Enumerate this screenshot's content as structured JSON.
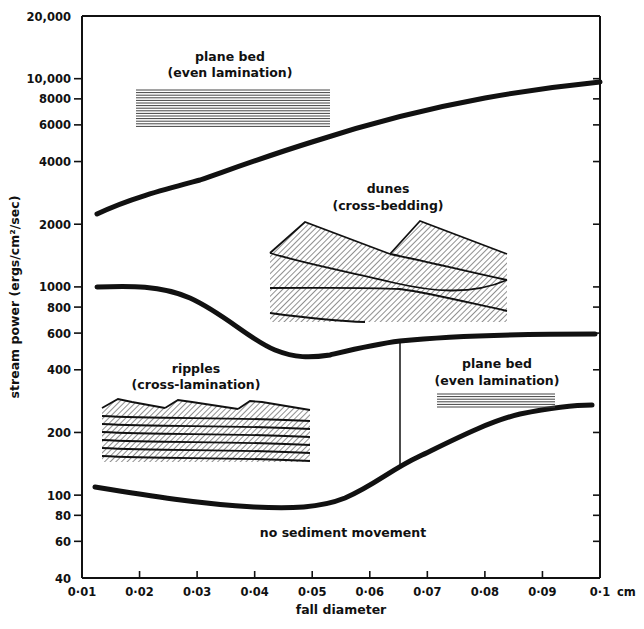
{
  "chart_data": {
    "type": "line",
    "title": "",
    "xlabel": "fall diameter",
    "x_unit": "cm",
    "ylabel": "stream power (ergs/cm²/sec)",
    "yscale": "log",
    "xlim": [
      0.01,
      0.1
    ],
    "ylim": [
      40,
      20000
    ],
    "grid": false,
    "legend": "none",
    "x_ticks": [
      "0·01",
      "0·02",
      "0·03",
      "0·04",
      "0·05",
      "0·06",
      "0·07",
      "0·08",
      "0·09",
      "0·1"
    ],
    "x_tick_values": [
      0.01,
      0.02,
      0.03,
      0.04,
      0.05,
      0.06,
      0.07,
      0.08,
      0.09,
      0.1
    ],
    "y_ticks": [
      "20,000",
      "10,000",
      "8000",
      "6000",
      "4000",
      "2000",
      "1000",
      "800",
      "600",
      "400",
      "200",
      "100",
      "80",
      "60",
      "40"
    ],
    "y_tick_values": [
      20000,
      10000,
      8000,
      6000,
      4000,
      2000,
      1000,
      800,
      600,
      400,
      200,
      100,
      80,
      60,
      40
    ],
    "series": [
      {
        "name": "upper boundary (dunes / upper plane bed)",
        "x": [
          0.0127,
          0.02,
          0.03,
          0.04,
          0.05,
          0.06,
          0.07,
          0.08,
          0.09,
          0.1
        ],
        "values": [
          2250,
          2700,
          3200,
          4000,
          4900,
          5900,
          6900,
          7900,
          8800,
          9700
        ]
      },
      {
        "name": "ripples / dunes boundary",
        "x": [
          0.0125,
          0.02,
          0.03,
          0.04,
          0.045,
          0.05,
          0.055,
          0.06,
          0.065,
          0.07,
          0.08,
          0.09,
          0.1
        ],
        "values": [
          1000,
          1000,
          900,
          640,
          510,
          465,
          480,
          520,
          550,
          570,
          590,
          600,
          600
        ]
      },
      {
        "name": "threshold of sediment movement",
        "x": [
          0.0125,
          0.02,
          0.03,
          0.04,
          0.045,
          0.05,
          0.055,
          0.06,
          0.065,
          0.07,
          0.08,
          0.09,
          0.099
        ],
        "values": [
          110,
          103,
          95,
          89,
          88,
          90,
          100,
          120,
          140,
          160,
          210,
          250,
          270
        ]
      },
      {
        "name": "ripples / lower plane bed boundary (vertical)",
        "x": [
          0.065,
          0.065
        ],
        "values": [
          140,
          550
        ]
      }
    ],
    "annotations": [
      {
        "text": "plane bed",
        "subtext": "(even lamination)",
        "region": "upper-left, above upper boundary"
      },
      {
        "text": "dunes",
        "subtext": "(cross-bedding)",
        "region": "between upper boundary and ripples/dunes boundary"
      },
      {
        "text": "ripples",
        "subtext": "(cross-lamination)",
        "region": "lower-left, below ripples/dunes boundary, d < 0.065 cm"
      },
      {
        "text": "plane bed",
        "subtext": "(even lamination)",
        "region": "lower-right, d > 0.065 cm"
      },
      {
        "text": "no sediment movement",
        "subtext": "",
        "region": "below threshold curve"
      }
    ]
  },
  "labels": {
    "ylabel": "stream power (ergs/cm²/sec)",
    "xlabel": "fall diameter",
    "x_unit": "cm",
    "upper_plane_bed_title": "plane bed",
    "upper_plane_bed_sub": "(even lamination)",
    "dunes_title": "dunes",
    "dunes_sub": "(cross-bedding)",
    "ripples_title": "ripples",
    "ripples_sub": "(cross-lamination)",
    "lower_plane_bed_title": "plane bed",
    "lower_plane_bed_sub": "(even lamination)",
    "no_movement": "no sediment movement"
  }
}
